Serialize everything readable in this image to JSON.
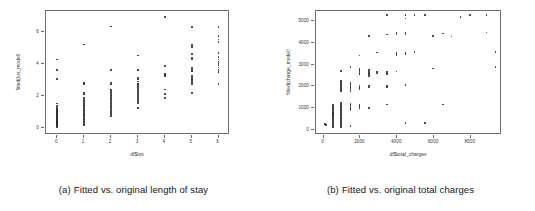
{
  "figure": {
    "panels": [
      {
        "id": "panel-a",
        "caption_tag": "(a)",
        "caption_text": "Fitted vs. original length of stay",
        "chart_data": {
          "type": "scatter",
          "title": "",
          "xlabel": "df$los",
          "ylabel": "fitted(los_model)",
          "xlim": [
            -0.42,
            6.42
          ],
          "ylim": [
            -0.45,
            7.3
          ],
          "xticks": [
            0,
            1,
            2,
            3,
            4,
            5,
            6
          ],
          "yticks": [
            0,
            2,
            4,
            6
          ],
          "grid": false,
          "legend": null,
          "marker": "open-circle",
          "color": "#2b2b2b",
          "points": [
            [
              0,
              0.05
            ],
            [
              0,
              0.1
            ],
            [
              0,
              0.14
            ],
            [
              0,
              0.18
            ],
            [
              0,
              0.22
            ],
            [
              0,
              0.26
            ],
            [
              0,
              0.3
            ],
            [
              0,
              0.34
            ],
            [
              0,
              0.38
            ],
            [
              0,
              0.42
            ],
            [
              0,
              0.46
            ],
            [
              0,
              0.5
            ],
            [
              0,
              0.55
            ],
            [
              0,
              0.6
            ],
            [
              0,
              0.65
            ],
            [
              0,
              0.7
            ],
            [
              0,
              0.75
            ],
            [
              0,
              0.8
            ],
            [
              0,
              0.85
            ],
            [
              0,
              0.9
            ],
            [
              0,
              0.95
            ],
            [
              0,
              1.0
            ],
            [
              0,
              1.05
            ],
            [
              0,
              1.1
            ],
            [
              0,
              1.15
            ],
            [
              0,
              1.2
            ],
            [
              0,
              1.28
            ],
            [
              0,
              1.38
            ],
            [
              0,
              1.52
            ],
            [
              0,
              3.05
            ],
            [
              0,
              3.62
            ],
            [
              0,
              4.28
            ],
            [
              1,
              0.18
            ],
            [
              1,
              0.25
            ],
            [
              1,
              0.32
            ],
            [
              1,
              0.4
            ],
            [
              1,
              0.48
            ],
            [
              1,
              0.56
            ],
            [
              1,
              0.64
            ],
            [
              1,
              0.72
            ],
            [
              1,
              0.8
            ],
            [
              1,
              0.88
            ],
            [
              1,
              0.96
            ],
            [
              1,
              1.04
            ],
            [
              1,
              1.12
            ],
            [
              1,
              1.2
            ],
            [
              1,
              1.28
            ],
            [
              1,
              1.36
            ],
            [
              1,
              1.44
            ],
            [
              1,
              1.52
            ],
            [
              1,
              1.6
            ],
            [
              1,
              1.72
            ],
            [
              1,
              1.86
            ],
            [
              1,
              2.08
            ],
            [
              1,
              2.18
            ],
            [
              1,
              2.72
            ],
            [
              1,
              2.8
            ],
            [
              1,
              5.2
            ],
            [
              2,
              0.72
            ],
            [
              2,
              0.82
            ],
            [
              2,
              0.92
            ],
            [
              2,
              1.02
            ],
            [
              2,
              1.12
            ],
            [
              2,
              1.22
            ],
            [
              2,
              1.32
            ],
            [
              2,
              1.42
            ],
            [
              2,
              1.52
            ],
            [
              2,
              1.62
            ],
            [
              2,
              1.72
            ],
            [
              2,
              1.82
            ],
            [
              2,
              1.92
            ],
            [
              2,
              2.02
            ],
            [
              2,
              2.12
            ],
            [
              2,
              2.22
            ],
            [
              2,
              2.32
            ],
            [
              2,
              2.4
            ],
            [
              2,
              2.7
            ],
            [
              2,
              2.8
            ],
            [
              2,
              3.6
            ],
            [
              2,
              6.32
            ],
            [
              3,
              1.22
            ],
            [
              3,
              1.55
            ],
            [
              3,
              1.68
            ],
            [
              3,
              1.78
            ],
            [
              3,
              1.88
            ],
            [
              3,
              1.98
            ],
            [
              3,
              2.08
            ],
            [
              3,
              2.18
            ],
            [
              3,
              2.28
            ],
            [
              3,
              2.38
            ],
            [
              3,
              2.48
            ],
            [
              3,
              2.58
            ],
            [
              3,
              2.68
            ],
            [
              3,
              2.78
            ],
            [
              3,
              2.9
            ],
            [
              3,
              3.02
            ],
            [
              3,
              3.1
            ],
            [
              3,
              2.72
            ],
            [
              3,
              4.52
            ],
            [
              3,
              3.62
            ],
            [
              4,
              1.88
            ],
            [
              4,
              2.12
            ],
            [
              4,
              2.4
            ],
            [
              4,
              3.22
            ],
            [
              4,
              3.3
            ],
            [
              4,
              3.38
            ],
            [
              4,
              3.88
            ],
            [
              4,
              6.92
            ],
            [
              5,
              2.18
            ],
            [
              5,
              2.72
            ],
            [
              5,
              2.82
            ],
            [
              5,
              2.92
            ],
            [
              5,
              3.02
            ],
            [
              5,
              3.12
            ],
            [
              5,
              3.22
            ],
            [
              5,
              3.52
            ],
            [
              5,
              3.62
            ],
            [
              5,
              3.72
            ],
            [
              5,
              4.28
            ],
            [
              5,
              4.38
            ],
            [
              5,
              4.62
            ],
            [
              5,
              5.05
            ],
            [
              5,
              5.18
            ],
            [
              5,
              6.3
            ],
            [
              6,
              2.72
            ],
            [
              6,
              3.5
            ],
            [
              6,
              3.62
            ],
            [
              6,
              3.78
            ],
            [
              6,
              3.92
            ],
            [
              6,
              4.02
            ],
            [
              6,
              4.12
            ],
            [
              6,
              4.28
            ],
            [
              6,
              4.42
            ],
            [
              6,
              4.68
            ],
            [
              6,
              5.38
            ],
            [
              6,
              5.52
            ],
            [
              6,
              5.72
            ],
            [
              6,
              6.3
            ]
          ]
        }
      },
      {
        "id": "panel-b",
        "caption_tag": "(b)",
        "caption_text": "Fitted vs. original total charges",
        "chart_data": {
          "type": "scatter",
          "title": "",
          "xlabel": "df$total_charges",
          "ylabel": "fitted(charge_model)",
          "xlim": [
            -420,
            9700
          ],
          "ylim": [
            -220,
            5450
          ],
          "xticks": [
            0,
            2000,
            4000,
            6000,
            8000
          ],
          "yticks": [
            0,
            1000,
            2000,
            3000,
            4000,
            5000
          ],
          "grid": false,
          "legend": null,
          "marker": "open-circle",
          "color": "#2b2b2b",
          "points": [
            [
              60,
              260
            ],
            [
              60,
              300
            ],
            [
              120,
              240
            ],
            [
              500,
              120
            ],
            [
              500,
              180
            ],
            [
              500,
              240
            ],
            [
              500,
              300
            ],
            [
              500,
              360
            ],
            [
              500,
              420
            ],
            [
              500,
              480
            ],
            [
              500,
              540
            ],
            [
              500,
              600
            ],
            [
              500,
              660
            ],
            [
              500,
              720
            ],
            [
              500,
              780
            ],
            [
              500,
              840
            ],
            [
              500,
              900
            ],
            [
              500,
              960
            ],
            [
              500,
              1020
            ],
            [
              500,
              1080
            ],
            [
              500,
              1140
            ],
            [
              500,
              700
            ],
            [
              500,
              760
            ],
            [
              950,
              150
            ],
            [
              950,
              210
            ],
            [
              950,
              270
            ],
            [
              950,
              330
            ],
            [
              950,
              390
            ],
            [
              950,
              450
            ],
            [
              950,
              510
            ],
            [
              950,
              570
            ],
            [
              950,
              630
            ],
            [
              950,
              690
            ],
            [
              950,
              750
            ],
            [
              950,
              810
            ],
            [
              950,
              870
            ],
            [
              950,
              930
            ],
            [
              950,
              990
            ],
            [
              950,
              1050
            ],
            [
              950,
              1110
            ],
            [
              950,
              1170
            ],
            [
              950,
              1230
            ],
            [
              950,
              1780
            ],
            [
              950,
              1840
            ],
            [
              950,
              1900
            ],
            [
              950,
              1960
            ],
            [
              950,
              2020
            ],
            [
              950,
              2080
            ],
            [
              950,
              2140
            ],
            [
              950,
              2200
            ],
            [
              950,
              2260
            ],
            [
              950,
              2700
            ],
            [
              1450,
              180
            ],
            [
              1450,
              900
            ],
            [
              1450,
              960
            ],
            [
              1450,
              1020
            ],
            [
              1450,
              1080
            ],
            [
              1450,
              1140
            ],
            [
              1450,
              1200
            ],
            [
              1450,
              1800
            ],
            [
              1450,
              1860
            ],
            [
              1450,
              1920
            ],
            [
              1450,
              1980
            ],
            [
              1450,
              2040
            ],
            [
              1450,
              2100
            ],
            [
              1450,
              2160
            ],
            [
              1450,
              2880
            ],
            [
              1950,
              1020
            ],
            [
              1950,
              1100
            ],
            [
              1950,
              1160
            ],
            [
              1950,
              1860
            ],
            [
              1950,
              1920
            ],
            [
              1950,
              1980
            ],
            [
              1950,
              2040
            ],
            [
              1950,
              2560
            ],
            [
              1950,
              2620
            ],
            [
              1950,
              2680
            ],
            [
              1950,
              2740
            ],
            [
              1950,
              2800
            ],
            [
              1950,
              3420
            ],
            [
              2450,
              1020
            ],
            [
              2450,
              1960
            ],
            [
              2450,
              2020
            ],
            [
              2450,
              2480
            ],
            [
              2450,
              2560
            ],
            [
              2450,
              2620
            ],
            [
              2450,
              2680
            ],
            [
              2450,
              2740
            ],
            [
              2450,
              4320
            ],
            [
              2900,
              2620
            ],
            [
              2900,
              2680
            ],
            [
              2900,
              3560
            ],
            [
              3450,
              1180
            ],
            [
              3450,
              1980
            ],
            [
              3450,
              2020
            ],
            [
              3450,
              2560
            ],
            [
              3450,
              2620
            ],
            [
              3450,
              2680
            ],
            [
              3450,
              4380
            ],
            [
              3450,
              5280
            ],
            [
              3950,
              2680
            ],
            [
              3950,
              3420
            ],
            [
              3950,
              3480
            ],
            [
              3950,
              3540
            ],
            [
              3950,
              4380
            ],
            [
              3950,
              4440
            ],
            [
              4450,
              340
            ],
            [
              4450,
              2060
            ],
            [
              4450,
              3480
            ],
            [
              4450,
              3540
            ],
            [
              4450,
              4380
            ],
            [
              4450,
              4440
            ],
            [
              4450,
              5100
            ],
            [
              4450,
              5280
            ],
            [
              4950,
              3580
            ],
            [
              4950,
              5280
            ],
            [
              5500,
              340
            ],
            [
              5500,
              5280
            ],
            [
              5950,
              2820
            ],
            [
              5950,
              4320
            ],
            [
              6500,
              1180
            ],
            [
              6500,
              4420
            ],
            [
              6950,
              4280
            ],
            [
              7450,
              5180
            ],
            [
              7950,
              5280
            ],
            [
              8850,
              4460
            ],
            [
              8850,
              5280
            ],
            [
              9350,
              2900
            ],
            [
              9350,
              3580
            ]
          ]
        }
      }
    ]
  }
}
